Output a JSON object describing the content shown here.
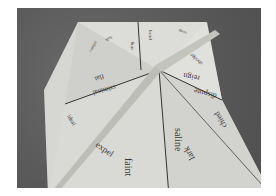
{
  "scene": {
    "description": "Photo of a folded paper fortune-teller style square with words printed on triangular flaps, on a dark gray surface",
    "background_color": "#5e5e5e",
    "paper_color": "#d9d9d6"
  },
  "words": {
    "w1": "faint",
    "w2": "saline",
    "w3": "lark",
    "w4": "chied",
    "w5": "dispute",
    "w6": "reign",
    "w7": "abridge",
    "w8": "scrap",
    "w9": "bend",
    "w10": "sing",
    "w11": "balk",
    "w12": "compel",
    "w13": "flat",
    "w14": "criminal",
    "w15": "ideal",
    "w16": "expel"
  }
}
